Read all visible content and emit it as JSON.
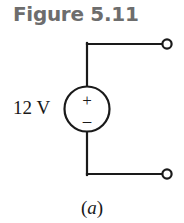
{
  "figure": {
    "title": "Figure 5.11",
    "title_color": "#6d6d6d",
    "caption_open_paren": "(",
    "caption_letter": "a",
    "caption_close_paren": ")"
  },
  "circuit": {
    "source": {
      "label": "12 V",
      "plus_sign": "+",
      "minus_sign": "–",
      "symbol": "voltage-source-circle",
      "stroke_color": "#1a1a1a"
    },
    "terminals": [
      {
        "name": "top-right-terminal",
        "cx": 167,
        "cy": 44,
        "r": 5
      },
      {
        "name": "bottom-right-terminal",
        "cx": 167,
        "cy": 174,
        "r": 5
      }
    ],
    "wires": [
      {
        "name": "top-horizontal-wire",
        "x1": 87,
        "y1": 44,
        "x2": 162,
        "y2": 44
      },
      {
        "name": "top-vertical-wire",
        "x1": 87,
        "y1": 44,
        "x2": 87,
        "y2": 86
      },
      {
        "name": "bottom-vertical-wire",
        "x1": 87,
        "y1": 132,
        "x2": 87,
        "y2": 174
      },
      {
        "name": "bottom-horizontal-wire",
        "x1": 87,
        "y1": 174,
        "x2": 162,
        "y2": 174
      }
    ]
  }
}
